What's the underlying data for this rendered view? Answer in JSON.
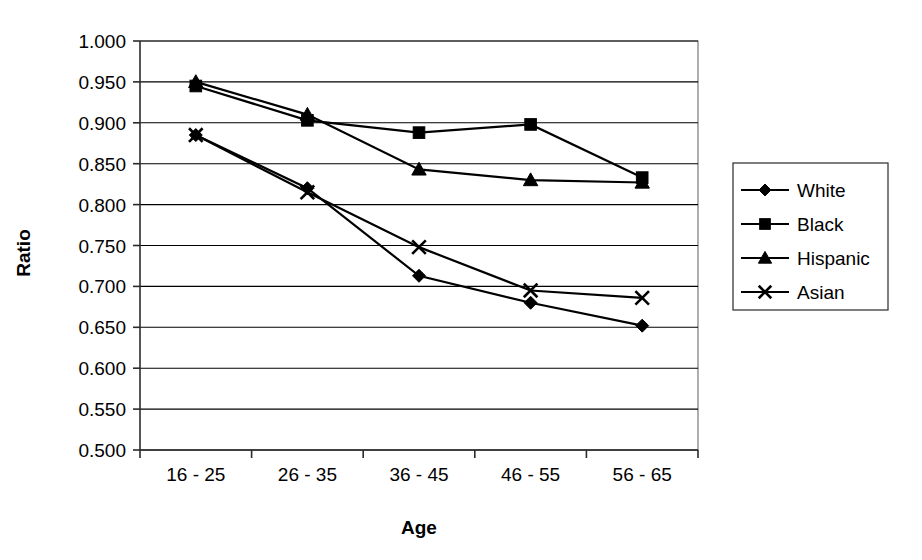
{
  "chart_data": {
    "type": "line",
    "title": "",
    "xlabel": "Age",
    "ylabel": "Ratio",
    "categories": [
      "16 - 25",
      "26 - 35",
      "36 - 45",
      "46 - 55",
      "56 - 65"
    ],
    "ylim": [
      0.5,
      1.0
    ],
    "ytick_step": 0.05,
    "ytick_labels": [
      "1.000",
      "0.950",
      "0.900",
      "0.850",
      "0.800",
      "0.750",
      "0.700",
      "0.650",
      "0.600",
      "0.550",
      "0.500"
    ],
    "ytick_values": [
      1.0,
      0.95,
      0.9,
      0.85,
      0.8,
      0.75,
      0.7,
      0.65,
      0.6,
      0.55,
      0.5
    ],
    "grid": true,
    "grid_axis": "y",
    "legend_position": "right",
    "series": [
      {
        "name": "White",
        "marker": "diamond",
        "color": "#000000",
        "values": [
          0.885,
          0.82,
          0.713,
          0.68,
          0.652
        ]
      },
      {
        "name": "Black",
        "marker": "square",
        "color": "#000000",
        "values": [
          0.945,
          0.903,
          0.888,
          0.898,
          0.833
        ]
      },
      {
        "name": "Hispanic",
        "marker": "triangle",
        "color": "#000000",
        "values": [
          0.95,
          0.91,
          0.843,
          0.83,
          0.827
        ]
      },
      {
        "name": "Asian",
        "marker": "x",
        "color": "#000000",
        "values": [
          0.885,
          0.815,
          0.748,
          0.695,
          0.686
        ]
      }
    ]
  },
  "legend": {
    "items": [
      {
        "label": "White"
      },
      {
        "label": "Black"
      },
      {
        "label": "Hispanic"
      },
      {
        "label": "Asian"
      }
    ]
  },
  "axes": {
    "y_title": "Ratio",
    "x_title": "Age"
  }
}
